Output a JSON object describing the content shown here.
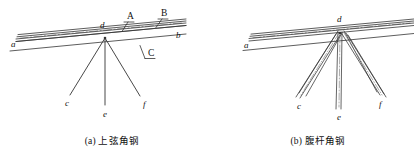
{
  "figure": {
    "panels": [
      {
        "id": "panel-a",
        "caption": "(a) 上弦角钢",
        "node_labels": [
          {
            "key": "a",
            "text": "a",
            "x": 11,
            "y": 40
          },
          {
            "key": "b",
            "text": "b",
            "x": 176,
            "y": 31
          },
          {
            "key": "d",
            "text": "d",
            "x": 100,
            "y": 21
          },
          {
            "key": "c",
            "text": "c",
            "x": 65,
            "y": 99
          },
          {
            "key": "e",
            "text": "e",
            "x": 103,
            "y": 110
          },
          {
            "key": "f",
            "text": "f",
            "x": 143,
            "y": 100
          }
        ],
        "weld_labels": [
          {
            "key": "A",
            "text": "A",
            "x": 127,
            "y": 12
          },
          {
            "key": "B",
            "text": "B",
            "x": 161,
            "y": 9
          },
          {
            "key": "C",
            "text": "C",
            "x": 148,
            "y": 49
          }
        ]
      },
      {
        "id": "panel-b",
        "caption": "(b) 腹杆角钢",
        "node_labels": [
          {
            "key": "a",
            "text": "a",
            "x": 244,
            "y": 41
          },
          {
            "key": "d",
            "text": "d",
            "x": 337,
            "y": 15
          },
          {
            "key": "c",
            "text": "c",
            "x": 297,
            "y": 102
          },
          {
            "key": "e",
            "text": "e",
            "x": 337,
            "y": 113
          },
          {
            "key": "f",
            "text": "f",
            "x": 379,
            "y": 100
          }
        ],
        "weld_labels": []
      }
    ],
    "colors": {
      "line": "#333333",
      "text": "#111111",
      "background": "#ffffff"
    }
  }
}
